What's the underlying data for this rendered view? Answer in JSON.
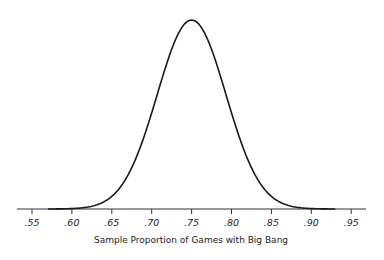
{
  "chart_data": {
    "type": "line",
    "title": "",
    "xlabel": "Sample Proportion of Games with Big Bang",
    "ylabel": "",
    "distribution": {
      "kind": "normal",
      "mean": 0.75,
      "sd": 0.043
    },
    "x_ticks": [
      0.55,
      0.6,
      0.65,
      0.7,
      0.75,
      0.8,
      0.85,
      0.9,
      0.95
    ],
    "x_tick_labels": [
      ".55",
      ".60",
      ".65",
      ".70",
      ".75",
      ".80",
      ".85",
      ".90",
      ".95"
    ],
    "xlim": [
      0.53,
      0.97
    ],
    "y_axis_shown": false,
    "grid": false,
    "legend": null,
    "series": [
      {
        "name": "density",
        "x": [
          0.57,
          0.6,
          0.65,
          0.7,
          0.75,
          0.8,
          0.85,
          0.9,
          0.93
        ],
        "relative_height": [
          0.0,
          0.002,
          0.07,
          0.52,
          1.0,
          0.52,
          0.07,
          0.002,
          0.0
        ]
      }
    ]
  },
  "colors": {
    "curve": "#1a1a1a",
    "axis": "#333333",
    "background": "#ffffff"
  }
}
